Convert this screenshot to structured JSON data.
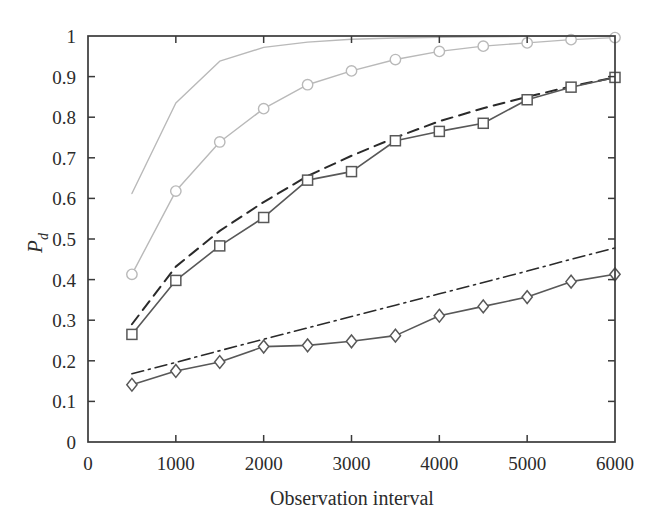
{
  "chart_data": {
    "type": "line",
    "title": "",
    "xlabel": "Observation interval",
    "ylabel": "P_d",
    "ylabel_base": "P",
    "ylabel_sub": "d",
    "xlim": [
      0,
      6000
    ],
    "ylim": [
      0,
      1
    ],
    "xticks": [
      0,
      1000,
      2000,
      3000,
      4000,
      5000,
      6000
    ],
    "xtick_labels": [
      "0",
      "1000",
      "2000",
      "3000",
      "4000",
      "5000",
      "6000"
    ],
    "yticks": [
      0,
      0.1,
      0.2,
      0.3,
      0.4,
      0.5,
      0.6,
      0.7,
      0.8,
      0.9,
      1
    ],
    "ytick_labels": [
      "0",
      "0.1",
      "0.2",
      "0.3",
      "0.4",
      "0.5",
      "0.6",
      "0.7",
      "0.8",
      "0.9",
      "1"
    ],
    "grid": false,
    "legend": "none",
    "box": true,
    "colors": {
      "light_gray": "#b9b9b9",
      "dark_gray": "#585858",
      "black": "#2a2a2a",
      "axis": "#3a3a3a",
      "background": "#ffffff"
    },
    "series": [
      {
        "name": "upper-plain-gray-line",
        "style": "solid",
        "marker": "none",
        "color": "#b9b9b9",
        "width": 1.4,
        "x": [
          500,
          1000,
          1500,
          2000,
          2500,
          3000,
          3500,
          4000,
          4500,
          5000,
          5500,
          6000
        ],
        "values": [
          0.612,
          0.835,
          0.938,
          0.972,
          0.985,
          0.992,
          0.995,
          0.997,
          0.998,
          0.999,
          0.999,
          1.0
        ]
      },
      {
        "name": "gray-circle-series",
        "style": "solid",
        "marker": "circle",
        "color": "#b9b9b9",
        "width": 1.4,
        "x": [
          500,
          1000,
          1500,
          2000,
          2500,
          3000,
          3500,
          4000,
          4500,
          5000,
          5500,
          6000
        ],
        "values": [
          0.413,
          0.618,
          0.739,
          0.821,
          0.88,
          0.914,
          0.942,
          0.962,
          0.975,
          0.983,
          0.991,
          0.996
        ]
      },
      {
        "name": "black-dashed-line",
        "style": "dashed",
        "marker": "none",
        "color": "#2a2a2a",
        "width": 2.0,
        "x": [
          500,
          1000,
          1500,
          2000,
          2500,
          3000,
          3500,
          4000,
          4500,
          5000,
          5500,
          6000
        ],
        "values": [
          0.29,
          0.432,
          0.52,
          0.591,
          0.655,
          0.705,
          0.75,
          0.79,
          0.822,
          0.85,
          0.876,
          0.898
        ]
      },
      {
        "name": "dark-square-series",
        "style": "solid",
        "marker": "square",
        "color": "#585858",
        "width": 1.6,
        "x": [
          500,
          1000,
          1500,
          2000,
          2500,
          3000,
          3500,
          4000,
          4500,
          5000,
          5500,
          6000
        ],
        "values": [
          0.265,
          0.398,
          0.483,
          0.553,
          0.645,
          0.666,
          0.742,
          0.765,
          0.785,
          0.843,
          0.874,
          0.898
        ]
      },
      {
        "name": "black-dashdot-line",
        "style": "dashdot",
        "marker": "none",
        "color": "#2a2a2a",
        "width": 1.6,
        "x": [
          500,
          1000,
          1500,
          2000,
          2500,
          3000,
          3500,
          4000,
          4500,
          5000,
          5500,
          6000
        ],
        "values": [
          0.168,
          0.196,
          0.225,
          0.253,
          0.281,
          0.309,
          0.337,
          0.365,
          0.393,
          0.421,
          0.45,
          0.478
        ]
      },
      {
        "name": "dark-diamond-series",
        "style": "solid",
        "marker": "diamond",
        "color": "#585858",
        "width": 1.6,
        "x": [
          500,
          1000,
          1500,
          2000,
          2500,
          3000,
          3500,
          4000,
          4500,
          5000,
          5500,
          6000
        ],
        "values": [
          0.141,
          0.175,
          0.197,
          0.235,
          0.238,
          0.248,
          0.262,
          0.311,
          0.334,
          0.357,
          0.395,
          0.413
        ]
      }
    ]
  }
}
